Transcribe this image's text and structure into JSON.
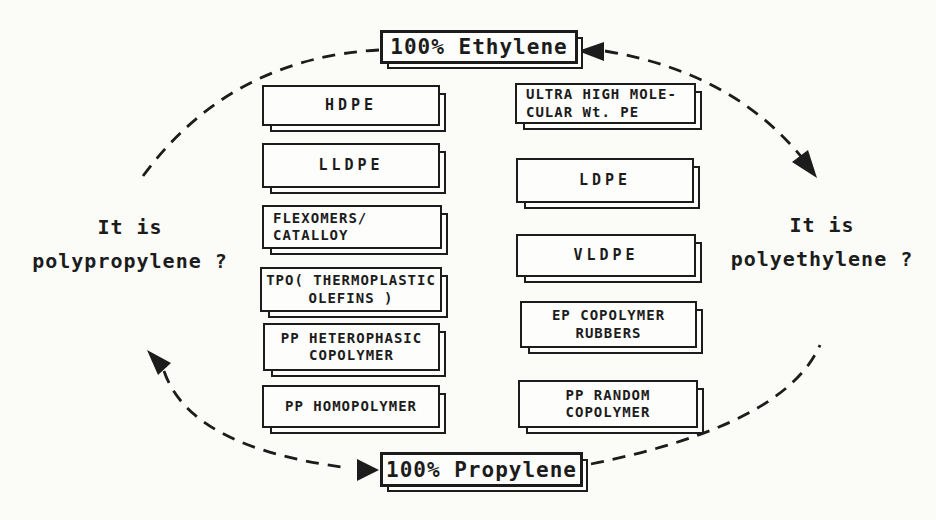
{
  "diagram": {
    "title_top": "100% Ethylene",
    "title_bottom": "100% Propylene",
    "question_left": {
      "line1": "It is",
      "line2": "polypropylene ?"
    },
    "question_right": {
      "line1": "It is",
      "line2": "polyethylene ?"
    },
    "left_column": [
      {
        "label": "HDPE"
      },
      {
        "label": "LLDPE"
      },
      {
        "label": "FLEXOMERS/\nCATALLOY"
      },
      {
        "label": "TPO( THERMOPLASTIC\nOLEFINS )"
      },
      {
        "label": "PP HETEROPHASIC\nCOPOLYMER"
      },
      {
        "label": "PP HOMOPOLYMER"
      }
    ],
    "right_column": [
      {
        "label": "ULTRA HIGH MOLE-\nCULAR Wt. PE"
      },
      {
        "label": "LDPE"
      },
      {
        "label": "VLDPE"
      },
      {
        "label": "EP COPOLYMER\nRUBBERS"
      },
      {
        "label": "PP RANDOM\nCOPOLYMER"
      }
    ],
    "colors": {
      "ink": "#1c1c1c",
      "paper": "#fbfbf8"
    }
  }
}
